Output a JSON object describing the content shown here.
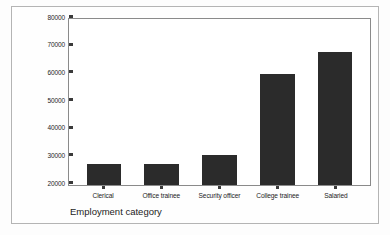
{
  "chart_data": {
    "type": "bar",
    "title": "",
    "subtitle": "",
    "xlabel": "Employment category",
    "ylabel": "Mean Current salary",
    "categories": [
      "Clerical",
      "Office trainee",
      "Security officer",
      "College trainee",
      "Salaried"
    ],
    "values": [
      27500,
      27500,
      31000,
      60000,
      68000
    ],
    "ylim": [
      20000,
      80000
    ],
    "yticks": [
      "20000",
      "30000",
      "40000",
      "50000",
      "60000",
      "70000",
      "80000"
    ],
    "ytick_values": [
      20000,
      30000,
      40000,
      50000,
      60000,
      70000,
      80000
    ],
    "grid": false,
    "legend": false,
    "legend_position": "none",
    "bar_color": "#2b2b2b",
    "plot_background": "#ffffff",
    "axis_color": "#8a8a8a",
    "frame_color": "#b4b4b4",
    "series": [
      {
        "name": "Mean Current salary",
        "values": [
          27500,
          27500,
          31000,
          60000,
          68000
        ]
      }
    ]
  }
}
